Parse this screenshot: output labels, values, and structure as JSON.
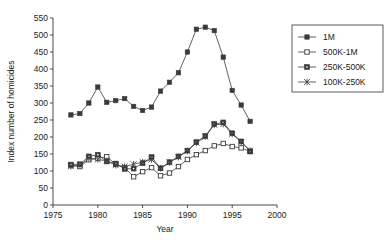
{
  "chart_data": {
    "type": "line",
    "title": "",
    "xlabel": "Year",
    "ylabel": "Index number of homicides",
    "xlim": [
      1975,
      2000
    ],
    "ylim": [
      0,
      550
    ],
    "xticks": [
      1975,
      1980,
      1985,
      1990,
      1995,
      2000
    ],
    "yticks": [
      0,
      50,
      100,
      150,
      200,
      250,
      300,
      350,
      400,
      450,
      500,
      550
    ],
    "grid": false,
    "legend_position": "right-top",
    "x": [
      1977,
      1978,
      1979,
      1980,
      1981,
      1982,
      1983,
      1984,
      1985,
      1986,
      1987,
      1988,
      1989,
      1990,
      1991,
      1992,
      1993,
      1994,
      1995,
      1996,
      1997
    ],
    "series": [
      {
        "name": "1M",
        "marker": "filled-square",
        "values": [
          265,
          269,
          300,
          347,
          302,
          307,
          313,
          290,
          278,
          288,
          335,
          361,
          389,
          450,
          517,
          523,
          513,
          435,
          337,
          294,
          246
        ]
      },
      {
        "name": "500K-1M",
        "marker": "open-square",
        "values": [
          116,
          113,
          133,
          138,
          142,
          120,
          110,
          83,
          98,
          110,
          86,
          94,
          113,
          134,
          148,
          160,
          174,
          181,
          172,
          168,
          157
        ]
      },
      {
        "name": "250K-500K",
        "marker": "dotted-square",
        "values": [
          119,
          120,
          143,
          148,
          128,
          122,
          106,
          107,
          123,
          141,
          108,
          126,
          143,
          160,
          185,
          203,
          238,
          243,
          211,
          187,
          158
        ]
      },
      {
        "name": "100K-250K",
        "marker": "asterisk",
        "values": [
          114,
          117,
          137,
          134,
          130,
          117,
          113,
          120,
          126,
          134,
          108,
          125,
          141,
          159,
          183,
          201,
          236,
          238,
          209,
          185,
          160
        ]
      }
    ]
  },
  "legend": {
    "items": [
      {
        "label": "1M"
      },
      {
        "label": "500K-1M"
      },
      {
        "label": "250K-500K"
      },
      {
        "label": "100K-250K"
      }
    ]
  },
  "colors": {
    "axis": "#4a4a4a",
    "series": "#3a3a3a",
    "background": "#ffffff",
    "text": "#1a1a1a"
  }
}
